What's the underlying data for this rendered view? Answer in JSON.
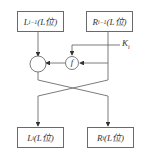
{
  "diagram": {
    "type": "feistel-round",
    "top_left_box": {
      "main": "L",
      "sub": "i−1",
      "suffix": "(L位)"
    },
    "top_right_box": {
      "main": "R",
      "sub": "i−1",
      "suffix": "(L位)"
    },
    "key_label": {
      "main": "K",
      "sub": "i"
    },
    "function_node": {
      "label": "f"
    },
    "xor_node": {
      "label": ""
    },
    "bottom_left_box": {
      "main": "L",
      "sub": "i",
      "suffix": "(L位)"
    },
    "bottom_right_box": {
      "main": "R",
      "sub": "i",
      "suffix": "(L位)"
    },
    "colors": {
      "line": "#5a5a5a",
      "box_border": "#6a6a6a",
      "text": "#333333"
    }
  }
}
